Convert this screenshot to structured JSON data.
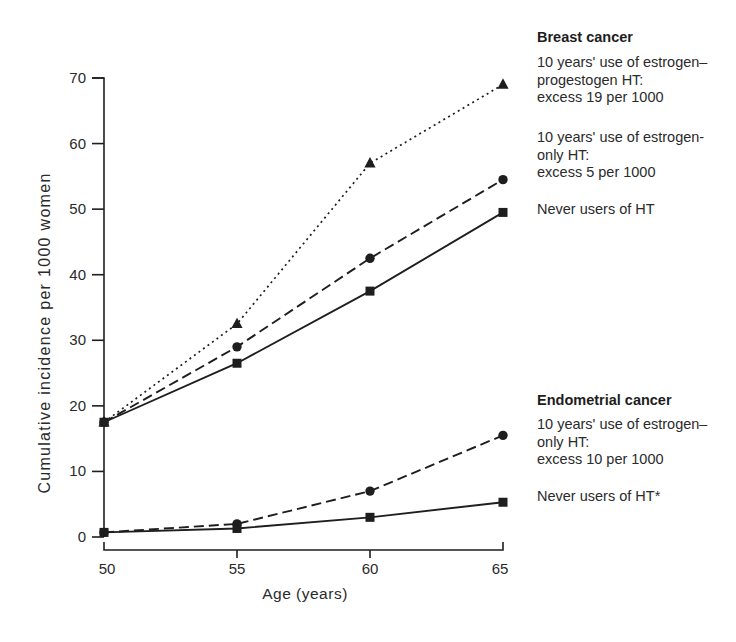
{
  "axis": {
    "x_title": "Age (years)",
    "y_title": "Cumulative incidence per 1000 women"
  },
  "annotations": {
    "breast_header": "Breast cancer",
    "breast_ep": "10 years' use of estrogen–\nprogestogen HT:\nexcess 19 per 1000",
    "breast_eo": "10 years' use of estrogen-\nonly HT:\nexcess 5 per 1000",
    "breast_never": "Never users of HT",
    "endo_header": "Endometrial cancer",
    "endo_eo": "10 years' use of estrogen–\nonly HT:\nexcess 10 per 1000",
    "endo_never": "Never users of HT*"
  },
  "chart_data": {
    "type": "line",
    "title": "",
    "xlabel": "Age (years)",
    "ylabel": "Cumulative incidence per 1000 women",
    "x": [
      50,
      55,
      60,
      65
    ],
    "xlim": [
      50,
      65
    ],
    "ylim": [
      0,
      70
    ],
    "yticks": [
      0,
      10,
      20,
      30,
      40,
      50,
      60,
      70
    ],
    "grid": false,
    "legend_position": "right-margin-annotations",
    "line_color": "#1e1e1e",
    "series": [
      {
        "group": "Breast cancer",
        "name": "10 years' use of estrogen–progestogen HT",
        "excess": "excess 19 per 1000",
        "marker": "triangle",
        "line_style": "dotted",
        "values": [
          17.5,
          32.5,
          57,
          69
        ]
      },
      {
        "group": "Breast cancer",
        "name": "10 years' use of estrogen-only HT",
        "excess": "excess 5 per 1000",
        "marker": "circle",
        "line_style": "dashed",
        "values": [
          17.5,
          29,
          42.5,
          54.5
        ]
      },
      {
        "group": "Breast cancer",
        "name": "Never users of HT",
        "excess": "",
        "marker": "square",
        "line_style": "solid",
        "values": [
          17.5,
          26.5,
          37.5,
          49.5
        ]
      },
      {
        "group": "Endometrial cancer",
        "name": "10 years' use of estrogen–only HT",
        "excess": "excess 10 per 1000",
        "marker": "circle",
        "line_style": "dashed",
        "values": [
          0.7,
          2,
          7,
          15.5
        ]
      },
      {
        "group": "Endometrial cancer",
        "name": "Never users of HT*",
        "excess": "",
        "marker": "square",
        "line_style": "solid",
        "values": [
          0.7,
          1.3,
          3,
          5.3
        ]
      }
    ]
  }
}
